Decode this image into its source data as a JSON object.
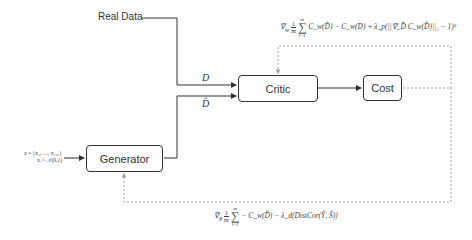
{
  "nodes": {
    "real_data": "Real Data",
    "critic": "Critic",
    "cost": "Cost",
    "generator": "Generator"
  },
  "edges": {
    "real_label": "D",
    "fake_label": "D̂"
  },
  "input": {
    "line1": "z = {x₁, …, x₁₀₀}",
    "line2": "xᵢ ~ 𝒩(0,1)"
  },
  "critic_loss": {
    "grad": "∇",
    "grad_sub": "w",
    "frac_num": "1",
    "frac_den": "m",
    "sum_top": "m",
    "sum_bottom": "i=1",
    "expr": "C_w(D̂) − C_w(D) + λ_p(||∇_D̂ C_w(D̂)||₂ − 1)²"
  },
  "generator_loss": {
    "grad": "∇",
    "grad_sub": "θ",
    "frac_num": "1",
    "frac_den": "m",
    "sum_top": "m",
    "sum_bottom": "i=1",
    "expr": "− C_w(D̂) − λ_d(DistCor(Ŷ, Ŝ))"
  },
  "colors": {
    "line": "#333333",
    "dotted": "#999999"
  }
}
